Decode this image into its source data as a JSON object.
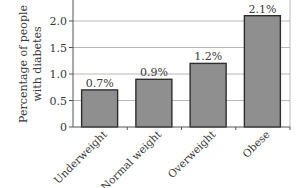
{
  "chart_data": {
    "type": "bar",
    "title": "",
    "xlabel": "",
    "ylabel": "Percentage of people with diabetes",
    "ylabel_lines": [
      "Percentage of people",
      "with diabetes"
    ],
    "categories": [
      "Underweight",
      "Normal weight",
      "Overweight",
      "Obese"
    ],
    "values": [
      0.7,
      0.9,
      1.2,
      2.1
    ],
    "data_labels": [
      "0.7%",
      "0.9%",
      "1.2%",
      "2.1%"
    ],
    "ylim": [
      0,
      2.5
    ],
    "yticks": [
      0,
      0.5,
      1.0,
      1.5,
      2.0
    ],
    "ytick_labels": [
      "0",
      "0.5",
      "1.0",
      "1.5",
      "2.0"
    ],
    "grid": true,
    "legend": "none",
    "colors": {
      "bar_fill": "#8f8f8f",
      "bar_edge": "#2e2e2e",
      "grid": "#b8b8b8"
    }
  }
}
